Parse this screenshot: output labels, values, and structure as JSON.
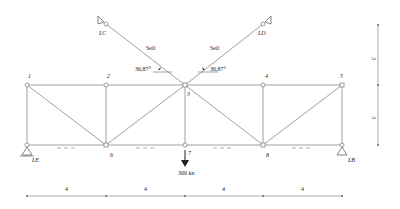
{
  "diagram": {
    "type": "truss",
    "nodes": [
      {
        "id": "1",
        "label": "1"
      },
      {
        "id": "2",
        "label": "2"
      },
      {
        "id": "3",
        "label": "3"
      },
      {
        "id": "4",
        "label": "4"
      },
      {
        "id": "5",
        "label": "5"
      },
      {
        "id": "6",
        "label": "6"
      },
      {
        "id": "7",
        "label": "7"
      },
      {
        "id": "8",
        "label": "8"
      }
    ],
    "supports": {
      "left_bottom": "LE",
      "right_bottom": "LB",
      "cable_left_anchor": "LC",
      "cable_right_anchor": "LD"
    },
    "cables": {
      "left_label": "Seil",
      "right_label": "Seil",
      "left_angle": "36,87°",
      "right_angle": "36,87°"
    },
    "load": {
      "label": "300 kn",
      "node": "7"
    },
    "dimensions": {
      "horizontal": [
        "4",
        "4",
        "4",
        "4"
      ],
      "vertical": [
        "3",
        "3"
      ]
    }
  }
}
